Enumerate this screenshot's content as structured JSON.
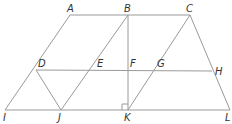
{
  "figure": {
    "line_color": "#9a9a9a",
    "label_color": "#333333",
    "points": [
      {
        "name": "A",
        "x": 70,
        "y": 15,
        "lx": 67,
        "ly": 12
      },
      {
        "name": "B",
        "x": 128,
        "y": 15,
        "lx": 124,
        "ly": 12
      },
      {
        "name": "C",
        "x": 190,
        "y": 15,
        "lx": 186,
        "ly": 12
      },
      {
        "name": "D",
        "x": 36,
        "y": 70,
        "lx": 38,
        "ly": 67
      },
      {
        "name": "E",
        "x": 95,
        "y": 70,
        "lx": 97,
        "ly": 67
      },
      {
        "name": "F",
        "x": 128,
        "y": 70,
        "lx": 130,
        "ly": 67
      },
      {
        "name": "G",
        "x": 155,
        "y": 70,
        "lx": 157,
        "ly": 67
      },
      {
        "name": "H",
        "x": 212,
        "y": 71,
        "lx": 215,
        "ly": 75
      },
      {
        "name": "I",
        "x": 5,
        "y": 110,
        "lx": 3,
        "ly": 121
      },
      {
        "name": "J",
        "x": 61,
        "y": 110,
        "lx": 58,
        "ly": 121
      },
      {
        "name": "K",
        "x": 128,
        "y": 110,
        "lx": 124,
        "ly": 121
      },
      {
        "name": "L",
        "x": 230,
        "y": 110,
        "lx": 225,
        "ly": 121
      }
    ],
    "segments": [
      [
        "A",
        "C"
      ],
      [
        "A",
        "I"
      ],
      [
        "B",
        "J"
      ],
      [
        "B",
        "K"
      ],
      [
        "C",
        "K"
      ],
      [
        "C",
        "L"
      ],
      [
        "D",
        "H"
      ],
      [
        "I",
        "L"
      ],
      [
        "D",
        "J"
      ]
    ],
    "right_angle": {
      "at": "K",
      "size": 6,
      "quadrant": "upper-left"
    }
  }
}
